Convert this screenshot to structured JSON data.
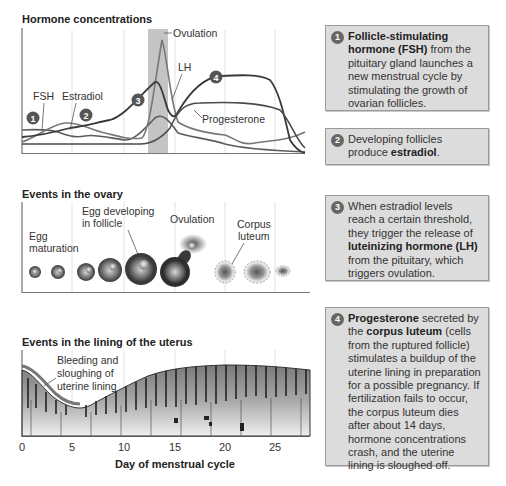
{
  "hormone_panel": {
    "title": "Hormone concentrations",
    "labels": {
      "ovulation": "Ovulation",
      "lh": "LH",
      "fsh": "FSH",
      "estradiol": "Estradiol",
      "progesterone": "Progesterone"
    },
    "badges": [
      "1",
      "2",
      "3",
      "4"
    ]
  },
  "ovary_panel": {
    "title": "Events in the ovary",
    "labels": {
      "egg_maturation_1": "Egg",
      "egg_maturation_2": "maturation",
      "egg_developing_1": "Egg developing",
      "egg_developing_2": "in follicle",
      "ovulation": "Ovulation",
      "corpus_1": "Corpus",
      "corpus_2": "luteum"
    }
  },
  "uterus_panel": {
    "title": "Events in the lining of the uterus",
    "labels": {
      "bleeding_1": "Bleeding and",
      "bleeding_2": "sloughing of",
      "bleeding_3": "uterine lining"
    }
  },
  "x_axis": {
    "title": "Day of menstrual cycle",
    "ticks": [
      "0",
      "5",
      "10",
      "15",
      "20",
      "25"
    ]
  },
  "callouts": [
    {
      "badge": "1",
      "bold1": "Follicle-stimulating hormone (FSH)",
      "text1": " from the pituitary gland launches a new menstrual cycle by stimulating the growth of ovarian follicles."
    },
    {
      "badge": "2",
      "text1": "Developing follicles produce ",
      "bold1": "estradiol",
      "text2": "."
    },
    {
      "badge": "3",
      "text1": "When estradiol levels reach a certain threshold, they trigger the release of ",
      "bold1": "luteinizing hormone (LH)",
      "text2": " from the pituitary, which triggers ovulation."
    },
    {
      "badge": "4",
      "bold1": "Progesterone",
      "text1": " secreted by the ",
      "bold2": "corpus luteum",
      "text2": " (cells from the ruptured follicle) stimulates a buildup of the uterine lining in preparation for a possible pregnancy. If fertilization fails to occur, the corpus luteum dies after about 14 days, hormone concentrations crash, and the uterine lining is sloughed off."
    }
  ],
  "colors": {
    "box_bg": "#dcdcdc",
    "box_border": "#9a9a9a",
    "badge": "#666666",
    "curve_dark": "#3a3a3a",
    "curve_mid": "#6a6a6a",
    "ovulation_band": "#c4c4c4"
  }
}
